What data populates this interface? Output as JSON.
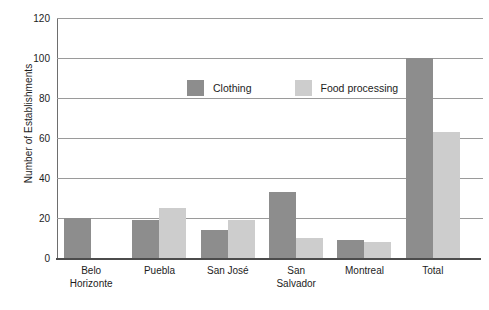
{
  "chart_data": {
    "type": "bar",
    "title": "",
    "subtitle": "",
    "xlabel": "",
    "ylabel": "Number of Establishments",
    "ylim": [
      0,
      120
    ],
    "yticks": [
      0,
      20,
      40,
      60,
      80,
      100,
      120
    ],
    "grid": true,
    "legend_position": "inside-top-center",
    "categories": [
      "Belo Horizonte",
      "Puebla",
      "San José",
      "San Salvador",
      "Montreal",
      "Total"
    ],
    "category_lines": [
      [
        "Belo",
        "Horizonte"
      ],
      [
        "Puebla"
      ],
      [
        "San José"
      ],
      [
        "San",
        "Salvador"
      ],
      [
        "Montreal"
      ],
      [
        "Total"
      ]
    ],
    "series": [
      {
        "name": "Clothing",
        "color": "#8d8d8d",
        "values": [
          20,
          19,
          14,
          33,
          9,
          100
        ]
      },
      {
        "name": "Food processing",
        "color": "#cdcdcd",
        "values": [
          null,
          25,
          19,
          10,
          8,
          63
        ]
      }
    ]
  },
  "axis": {
    "tick_labels": [
      "0",
      "20",
      "40",
      "60",
      "80",
      "100",
      "120"
    ]
  },
  "legend": {
    "entries": [
      {
        "label": "Clothing",
        "swatch": "clothing-swatch"
      },
      {
        "label": "Food processing",
        "swatch": "food-processing-swatch"
      }
    ]
  }
}
